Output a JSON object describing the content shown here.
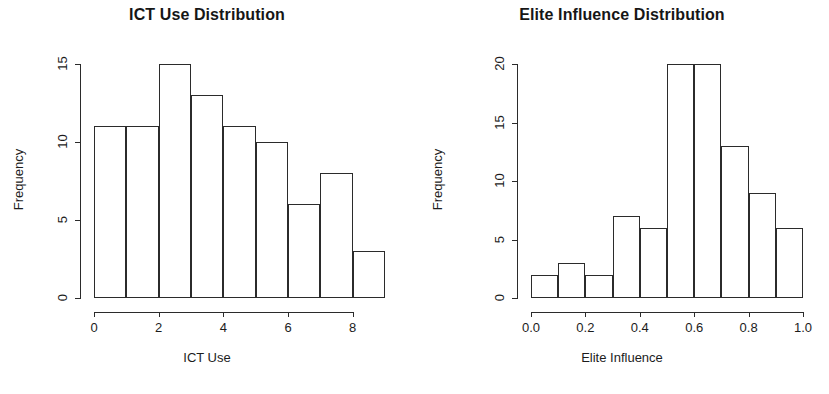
{
  "figure": {
    "background": "#ffffff",
    "foreground": "#2b2b2b",
    "width": 829,
    "height": 394
  },
  "panels": [
    {
      "id": "ict-use",
      "title": "ICT Use Distribution",
      "xlabel": "ICT Use",
      "ylabel": "Frequency",
      "xticks": [
        "0",
        "2",
        "4",
        "6",
        "8"
      ],
      "yticks": [
        "0",
        "5",
        "10",
        "15"
      ]
    },
    {
      "id": "elite-influence",
      "title": "Elite Influence Distribution",
      "xlabel": "Elite Influence",
      "ylabel": "Frequency",
      "xticks": [
        "0.0",
        "0.2",
        "0.4",
        "0.6",
        "0.8",
        "1.0"
      ],
      "yticks": [
        "0",
        "5",
        "10",
        "15",
        "20"
      ]
    }
  ],
  "chart_data": [
    {
      "type": "bar",
      "title": "ICT Use Distribution",
      "xlabel": "ICT Use",
      "ylabel": "Frequency",
      "bin_edges": [
        0,
        1,
        2,
        3,
        4,
        5,
        6,
        7,
        8,
        9
      ],
      "categories": [
        "0-1",
        "1-2",
        "2-3",
        "3-4",
        "4-5",
        "5-6",
        "6-7",
        "7-8",
        "8-9"
      ],
      "values": [
        11,
        11,
        15,
        13,
        11,
        10,
        6,
        8,
        3
      ],
      "xlim": [
        0,
        9
      ],
      "ylim": [
        0,
        15
      ],
      "xtick_values": [
        0,
        2,
        4,
        6,
        8
      ],
      "ytick_values": [
        0,
        5,
        10,
        15
      ],
      "grid": false,
      "legend": null
    },
    {
      "type": "bar",
      "title": "Elite Influence Distribution",
      "xlabel": "Elite Influence",
      "ylabel": "Frequency",
      "bin_edges": [
        0.0,
        0.1,
        0.2,
        0.3,
        0.4,
        0.5,
        0.6,
        0.7,
        0.8,
        0.9,
        1.0
      ],
      "categories": [
        "0.0-0.1",
        "0.1-0.2",
        "0.2-0.3",
        "0.3-0.4",
        "0.4-0.5",
        "0.5-0.6",
        "0.6-0.7",
        "0.7-0.8",
        "0.8-0.9",
        "0.9-1.0"
      ],
      "values": [
        2,
        3,
        2,
        7,
        6,
        20,
        20,
        13,
        9,
        6
      ],
      "xlim": [
        0.0,
        1.0
      ],
      "ylim": [
        0,
        20
      ],
      "xtick_values": [
        0.0,
        0.2,
        0.4,
        0.6,
        0.8,
        1.0
      ],
      "ytick_values": [
        0,
        5,
        10,
        15,
        20
      ],
      "grid": false,
      "legend": null
    }
  ]
}
